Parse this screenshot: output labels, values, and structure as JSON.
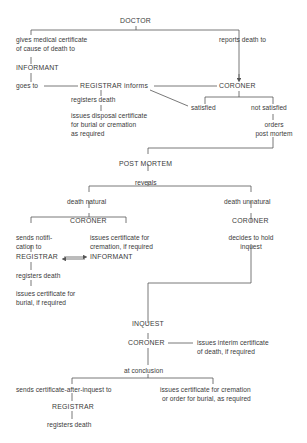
{
  "diagram": {
    "doctor": "DOCTOR",
    "gives_cert_1": "gives medical certificate",
    "gives_cert_2": "of cause of death to",
    "informant_top": "INFORMANT",
    "goes_to": "goes to",
    "registrar_informs": "REGISTRAR informs",
    "reports_death": "reports death to",
    "coroner_top": "CORONER",
    "registers_death_top": "registers death",
    "disposal_1": "issues disposal certificate",
    "disposal_2": "for burial or cremation",
    "disposal_3": "as required",
    "satisfied": "satisfied",
    "not_satisfied": "not satisfied",
    "orders_1": "orders",
    "orders_2": "post mortem",
    "post_mortem": "POST  MORTEM",
    "reveals": "reveals",
    "death_natural": "death natural",
    "death_unnatural": "death unnatural",
    "coroner_natural": "CORONER",
    "coroner_unnatural": "CORONER",
    "sends_notif_1": "sends notifi-",
    "sends_notif_2": "cation to",
    "cremation_cert_1": "issues certificate for",
    "cremation_cert_2": "cremation, if required",
    "decides_1": "decides to hold",
    "decides_2": "inquest",
    "registrar_mid": "REGISTRAR",
    "informant_mid": "INFORMANT",
    "registers_death_mid": "registers death",
    "burial_cert_1": "issues certificate for",
    "burial_cert_2": "burial, if required",
    "inquest": "INQUEST",
    "coroner_inquest": "CORONER",
    "interim_1": "issues interim certificate",
    "interim_2": "of death, if required",
    "at_conclusion": "at conclusion",
    "sends_after_inquest": "sends certificate-after-inquest to",
    "final_cert_1": "issues certificate for cremation",
    "final_cert_2": "or order for burial, as required",
    "registrar_bottom": "REGISTRAR",
    "registers_death_bottom": "registers death"
  }
}
